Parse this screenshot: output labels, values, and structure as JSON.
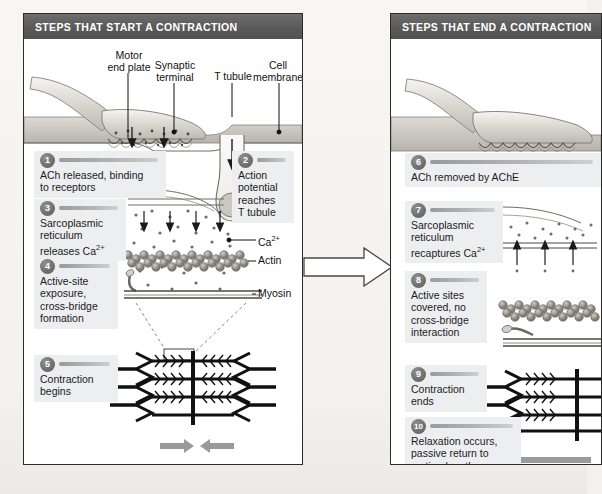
{
  "figure": {
    "title_left": "STEPS THAT START A CONTRACTION",
    "title_right": "STEPS THAT END A CONTRACTION",
    "transition_icon": "right-block-arrow"
  },
  "colors": {
    "header_bar": "#5a5a5a",
    "header_text": "#ffffff",
    "step_block_bg": "#eceef0",
    "badge": "#6f6f6f",
    "rule": "#b4b4b4",
    "page_bg": "#f3f2ef",
    "panel_bg": "#ffffff",
    "panel_border": "#2b2b2b",
    "ink": "#1b1b1b",
    "tissue": "#c9c7c0",
    "arrow_gray": "#8a8a8a"
  },
  "left_panel": {
    "title": "STEPS THAT START A CONTRACTION",
    "callouts": [
      {
        "name": "motor-end-plate",
        "text": "Motor\nend plate"
      },
      {
        "name": "synaptic-terminal",
        "text": "Synaptic\nterminal"
      },
      {
        "name": "t-tubule",
        "text": "T tubule"
      },
      {
        "name": "cell-membrane",
        "text": "Cell\nmembrane"
      },
      {
        "name": "calcium-ion",
        "text": "Ca2+"
      },
      {
        "name": "actin",
        "text": "Actin"
      },
      {
        "name": "myosin",
        "text": "Myosin"
      }
    ],
    "steps": [
      {
        "number": "1",
        "text": "ACh released, binding\nto receptors"
      },
      {
        "number": "2",
        "text": "Action\npotential\nreaches\nT tubule"
      },
      {
        "number": "3",
        "text": "Sarcoplasmic\nreticulum\nreleases Ca2+"
      },
      {
        "number": "4",
        "text": "Active-site\nexposure,\ncross-bridge\nformation"
      },
      {
        "number": "5",
        "text": "Contraction\nbegins"
      }
    ]
  },
  "right_panel": {
    "title": "STEPS THAT END A CONTRACTION",
    "steps": [
      {
        "number": "6",
        "text": "ACh removed by AChE"
      },
      {
        "number": "7",
        "text": "Sarcoplasmic\nreticulum\nrecaptures Ca2+"
      },
      {
        "number": "8",
        "text": "Active sites\ncovered, no\ncross-bridge\ninteraction"
      },
      {
        "number": "9",
        "text": "Contraction\nends"
      },
      {
        "number": "10",
        "text": "Relaxation occurs,\npassive return to\nresting length"
      }
    ]
  }
}
